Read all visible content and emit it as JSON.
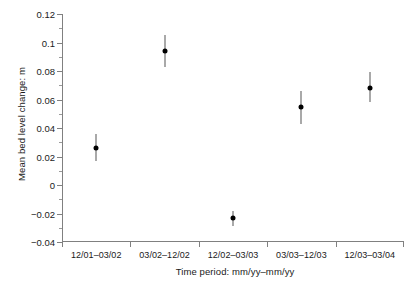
{
  "chart_data": {
    "type": "scatter",
    "title": "",
    "xlabel": "Time period: mm/yy–mm/yy",
    "ylabel": "Mean bed level change: m",
    "categories": [
      "12/01–03/02",
      "03/02–12/02",
      "12/02–03/03",
      "03/03–12/03",
      "12/03–03/04"
    ],
    "values": [
      0.026,
      0.094,
      -0.023,
      0.055,
      0.068
    ],
    "error_low": [
      0.017,
      0.083,
      -0.029,
      0.043,
      0.058
    ],
    "error_high": [
      0.036,
      0.105,
      -0.018,
      0.066,
      0.079
    ],
    "ylim": [
      -0.04,
      0.12
    ],
    "ytick_labels": [
      "0.12",
      "0.1",
      "0.08",
      "0.06",
      "0.04",
      "0.02",
      "0",
      "−0.02",
      "−0.04"
    ],
    "ytick_values": [
      0.12,
      0.1,
      0.08,
      0.06,
      0.04,
      0.02,
      0,
      -0.02,
      -0.04
    ],
    "ytick_step": 0.02,
    "minor_ticks": true,
    "grid": false,
    "legend": "none",
    "marker": "filled-circle",
    "marker_color": "#000000",
    "errorbar_color": "#555555",
    "axis_color": "#808080",
    "background": "#ffffff"
  }
}
